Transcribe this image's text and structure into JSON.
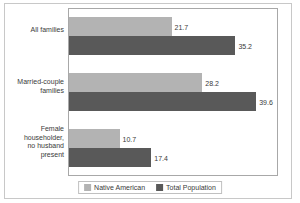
{
  "chart_data": {
    "type": "bar",
    "orientation": "horizontal",
    "title": "",
    "xlabel": "",
    "ylabel": "",
    "xlim": [
      0,
      44
    ],
    "grid": false,
    "legend_position": "bottom",
    "categories": [
      "All families",
      "Married-couple families",
      "Female householder, no husband present"
    ],
    "category_lines": [
      [
        "All families"
      ],
      [
        "Married-couple",
        "families"
      ],
      [
        "Female",
        "householder,",
        "no husband",
        "present"
      ]
    ],
    "series": [
      {
        "name": "Native American",
        "color": "#b3b3b3",
        "values": [
          21.7,
          28.2,
          10.7
        ],
        "labels": [
          "21.7",
          "28.2",
          "10.7"
        ]
      },
      {
        "name": "Total Population",
        "color": "#595959",
        "values": [
          35.2,
          39.6,
          17.4
        ],
        "labels": [
          "35.2",
          "39.6",
          "17.4"
        ]
      }
    ]
  },
  "legend": {
    "entries": [
      {
        "label": "Native American"
      },
      {
        "label": "Total Population"
      }
    ]
  }
}
